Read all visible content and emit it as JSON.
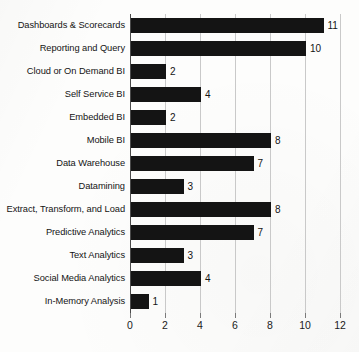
{
  "chart_data": {
    "type": "bar",
    "orientation": "horizontal",
    "title": "",
    "xlabel": "",
    "ylabel": "",
    "xlim": [
      0,
      12
    ],
    "xticks": [
      0,
      2,
      4,
      6,
      8,
      10,
      12
    ],
    "grid": true,
    "legend": false,
    "bar_color": "#141414",
    "gridline_color": "#c9c9c9",
    "axis_color": "#4a4a4a",
    "background_color": "#fdfdfc",
    "show_value_labels": true,
    "categories": [
      "Dashboards & Scorecards",
      "Reporting and Query",
      "Cloud or On Demand BI",
      "Self Service BI",
      "Embedded BI",
      "Mobile BI",
      "Data Warehouse",
      "Datamining",
      "Extract, Transform, and Load",
      "Predictive Analytics",
      "Text Analytics",
      "Social Media Analytics",
      "In-Memory Analysis"
    ],
    "values": [
      11,
      10,
      2,
      4,
      2,
      8,
      7,
      3,
      8,
      7,
      3,
      4,
      1
    ],
    "value_labels": [
      "11",
      "10",
      "2",
      "4",
      "2",
      "8",
      "7",
      "3",
      "8",
      "7",
      "3",
      "4",
      "1"
    ],
    "tick_labels": [
      "0",
      "2",
      "4",
      "6",
      "8",
      "10",
      "12"
    ]
  }
}
